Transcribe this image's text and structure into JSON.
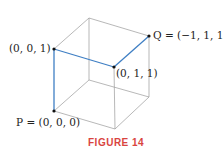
{
  "figure": {
    "caption": "FIGURE 14",
    "points": {
      "p": {
        "label": "P = (0, 0, 0)"
      },
      "a": {
        "label": "(0, 0, 1)"
      },
      "b": {
        "label": "(0, 1, 1)"
      },
      "q": {
        "label": "Q = (−1, 1, 1)"
      }
    },
    "colors": {
      "edge": "#9a9a9a",
      "path": "#3f7fc4",
      "caption": "#d9453f",
      "point": "#111111"
    }
  }
}
